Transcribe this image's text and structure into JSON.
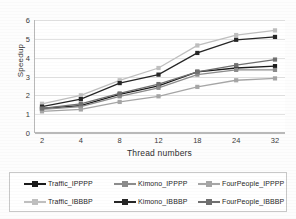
{
  "chart_data": {
    "type": "line",
    "title": "",
    "xlabel": "Thread numbers",
    "ylabel": "Speedup",
    "categories": [
      "2",
      "4",
      "8",
      "12",
      "18",
      "24",
      "32"
    ],
    "xlim": [
      0,
      6
    ],
    "ylim": [
      0,
      6
    ],
    "yticks": [
      "0",
      "1",
      "2",
      "3",
      "4",
      "5",
      "6"
    ],
    "grid": "horizontal",
    "legend_position": "bottom",
    "series": [
      {
        "name": "Traffic_IPPPP",
        "color": "#1a1a1a",
        "marker": "square",
        "values": [
          1.3,
          1.45,
          2.05,
          2.5,
          3.25,
          3.45,
          3.55
        ]
      },
      {
        "name": "Kimono_IPPPP",
        "color": "#8c8c8c",
        "marker": "square",
        "values": [
          1.25,
          1.4,
          1.95,
          2.4,
          3.1,
          3.35,
          3.35
        ]
      },
      {
        "name": "FourPeople_IPPPP",
        "color": "#a6a6a6",
        "marker": "square",
        "values": [
          1.15,
          1.25,
          1.65,
          1.95,
          2.45,
          2.8,
          2.9
        ]
      },
      {
        "name": "Traffic_IBBBP",
        "color": "#bfbfbf",
        "marker": "square",
        "values": [
          1.55,
          2.0,
          2.8,
          3.45,
          4.65,
          5.2,
          5.45
        ]
      },
      {
        "name": "Kimono_IBBBP",
        "color": "#262626",
        "marker": "square",
        "values": [
          1.4,
          1.8,
          2.65,
          3.1,
          4.25,
          4.95,
          5.1
        ]
      },
      {
        "name": "FourPeople_IBBBP",
        "color": "#707070",
        "marker": "square",
        "values": [
          1.3,
          1.55,
          2.1,
          2.6,
          3.25,
          3.6,
          3.9
        ]
      }
    ]
  },
  "legend": {
    "rows": [
      [
        "Traffic_IPPPP",
        "Kimono_IPPPP",
        "FourPeople_IPPPP"
      ],
      [
        "Traffic_IBBBP",
        "Kimono_IBBBP",
        "FourPeople_IBBBP"
      ]
    ]
  }
}
